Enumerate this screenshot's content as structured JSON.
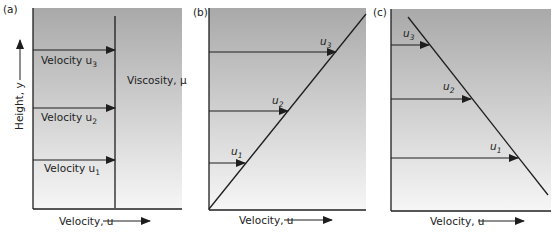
{
  "colors": {
    "gradient_top": "#a9a9a9",
    "gradient_bottom": "#f6f6f6",
    "line": "#1e1e1e"
  },
  "panels": [
    {
      "id": "a",
      "tag": "(a)",
      "y_axis_label": "Height, y",
      "x_axis_label": "Velocity, u",
      "profile": "uniform",
      "viscosity_label": "Viscosity, μ",
      "arrows": [
        {
          "label": "Velocity u",
          "sub": "3"
        },
        {
          "label": "Velocity u",
          "sub": "2"
        },
        {
          "label": "Velocity u",
          "sub": "1"
        }
      ]
    },
    {
      "id": "b",
      "tag": "(b)",
      "x_axis_label": "Velocity, u",
      "profile": "linear-increasing",
      "arrows": [
        {
          "label": "u",
          "sub": "3"
        },
        {
          "label": "u",
          "sub": "2"
        },
        {
          "label": "u",
          "sub": "1"
        }
      ]
    },
    {
      "id": "c",
      "tag": "(c)",
      "x_axis_label": "Velocity, u",
      "profile": "linear-decreasing",
      "arrows": [
        {
          "label": "u",
          "sub": "3"
        },
        {
          "label": "u",
          "sub": "2"
        },
        {
          "label": "u",
          "sub": "1"
        }
      ]
    }
  ]
}
